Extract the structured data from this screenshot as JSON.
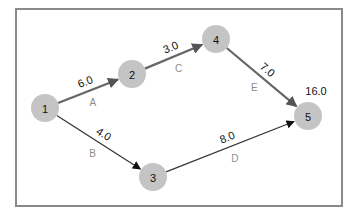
{
  "diagram": {
    "type": "activity-network",
    "colors": {
      "node_fill": "#c4c4c4",
      "critical_edge": "#666666",
      "normal_edge": "#333333",
      "arrow_critical": "#555555",
      "arrow_normal": "#111111",
      "activity_text": "#8c8c8c",
      "frame": "#8a8a8a"
    },
    "nodes": [
      {
        "id": "1",
        "label": "1"
      },
      {
        "id": "2",
        "label": "2"
      },
      {
        "id": "3",
        "label": "3"
      },
      {
        "id": "4",
        "label": "4"
      },
      {
        "id": "5",
        "label": "5"
      }
    ],
    "edges": [
      {
        "from": "1",
        "to": "2",
        "duration": "6.0",
        "activity": "A",
        "critical": true
      },
      {
        "from": "1",
        "to": "3",
        "duration": "4.0",
        "activity": "B",
        "critical": false
      },
      {
        "from": "2",
        "to": "4",
        "duration": "3.0",
        "activity": "C",
        "critical": true
      },
      {
        "from": "3",
        "to": "5",
        "duration": "8.0",
        "activity": "D",
        "critical": false
      },
      {
        "from": "4",
        "to": "5",
        "duration": "7.0",
        "activity": "E",
        "critical": true
      }
    ],
    "annotations": [
      {
        "node": "5",
        "text": "16.0"
      }
    ]
  }
}
